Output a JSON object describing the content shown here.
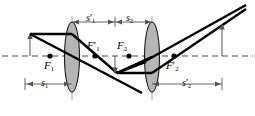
{
  "figure": {
    "type": "optics-ray-diagram",
    "axis_label": "optical-axis"
  },
  "labels": {
    "f1": {
      "text": "F",
      "sub": "1",
      "prime": "",
      "x": 44,
      "y": 60
    },
    "f1p": {
      "text": "F",
      "sub": "1",
      "prime": "′",
      "x": 88,
      "y": 41
    },
    "f2": {
      "text": "F",
      "sub": "2",
      "prime": "",
      "x": 117,
      "y": 41
    },
    "f2p": {
      "text": "F",
      "sub": "2",
      "prime": "′",
      "x": 166,
      "y": 60
    },
    "s1": {
      "text": "s",
      "sub": "1",
      "prime": "",
      "x": 41,
      "y": 81
    },
    "s1p": {
      "text": "s",
      "sub": "1",
      "prime": "′",
      "x": 87,
      "y": 15
    },
    "s2": {
      "text": "s",
      "sub": "2",
      "prime": "",
      "x": 126,
      "y": 15
    },
    "s2p": {
      "text": "s",
      "sub": "2",
      "prime": "′",
      "x": 183,
      "y": 81
    }
  },
  "elements": {
    "lens1_name": "converging-lens-1",
    "lens2_name": "converging-lens-2",
    "object_arrow_name": "object-arrow",
    "image_arrow_name": "final-image-arrow",
    "intermediate_arrow_name": "intermediate-image-arrow"
  },
  "colors": {
    "ink": "#000000",
    "lens_fill": "#b4b4b4",
    "lens_stroke": "#000000",
    "axis_dash": "#4d4d4d",
    "thin": "#808080"
  },
  "geometry": {
    "axis_y": 56,
    "lens1_x": 72,
    "lens2_x": 152,
    "lens_top": 22,
    "lens_bottom": 92,
    "lens_halfwidth": 7,
    "object_x": 30,
    "object_top": 35,
    "intermediate_x": 117,
    "intermediate_bottom": 73,
    "image_x": 222,
    "image_top": 24,
    "f1_x": 50,
    "f1p_x": 95,
    "f2_x": 129,
    "f2p_x": 174
  }
}
